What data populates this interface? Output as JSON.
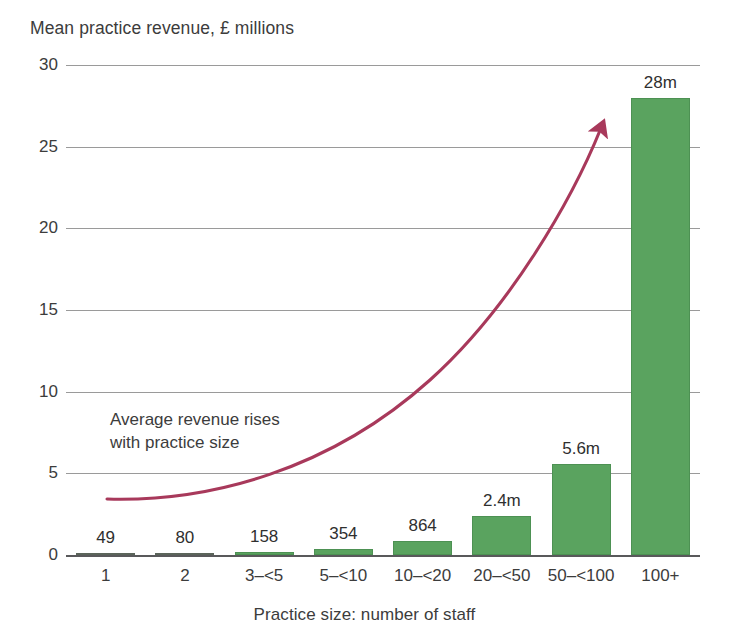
{
  "chart_data": {
    "type": "bar",
    "title": "",
    "ylabel": "Mean practice revenue, £ millions",
    "xlabel": "Practice size: number of staff",
    "ylim": [
      0,
      30
    ],
    "yticks": [
      0,
      5,
      10,
      15,
      20,
      25,
      30
    ],
    "ytick_labels": [
      "0",
      "5",
      "10",
      "15",
      "20",
      "25",
      "30"
    ],
    "grid": true,
    "legend": "none",
    "bar_color": "#5aa35f",
    "accent_color": "#a8395b",
    "categories": [
      "1",
      "2",
      "3–<5",
      "5–<10",
      "10–<20",
      "20–<50",
      "50–<100",
      "100+"
    ],
    "values": [
      0.049,
      0.08,
      0.158,
      0.354,
      0.864,
      2.4,
      5.6,
      28
    ],
    "value_labels": [
      "49",
      "80",
      "158",
      "354",
      "864",
      "2.4m",
      "5.6m",
      "28m"
    ],
    "annotations": [
      {
        "text": "Average revenue rises\nwith practice size",
        "kind": "text-note"
      },
      {
        "kind": "trend-arrow",
        "description": "rising curved arrow from left baseline to top right"
      }
    ]
  },
  "bars": [
    {
      "category": "1",
      "value": 0.049,
      "label": "49",
      "center_pct": 6.25,
      "tiny": true
    },
    {
      "category": "2",
      "value": 0.08,
      "label": "80",
      "center_pct": 18.75,
      "tiny": true
    },
    {
      "category": "3–<5",
      "value": 0.158,
      "label": "158",
      "center_pct": 31.25,
      "tiny": false
    },
    {
      "category": "5–<10",
      "value": 0.354,
      "label": "354",
      "center_pct": 43.75,
      "tiny": false
    },
    {
      "category": "10–<20",
      "value": 0.864,
      "label": "864",
      "center_pct": 56.25,
      "tiny": false
    },
    {
      "category": "20–<50",
      "value": 2.4,
      "label": "2.4m",
      "center_pct": 68.75,
      "tiny": false
    },
    {
      "category": "50–<100",
      "value": 5.6,
      "label": "5.6m",
      "center_pct": 81.25,
      "tiny": false
    },
    {
      "category": "100+",
      "value": 28,
      "label": "28m",
      "center_pct": 93.75,
      "tiny": false
    }
  ],
  "yticks": [
    {
      "value": 30,
      "label": "30"
    },
    {
      "value": 25,
      "label": "25"
    },
    {
      "value": 20,
      "label": "20"
    },
    {
      "value": 15,
      "label": "15"
    },
    {
      "value": 10,
      "label": "10"
    },
    {
      "value": 5,
      "label": "5"
    },
    {
      "value": 0,
      "label": "0"
    }
  ],
  "axis": {
    "y_title": "Mean practice revenue, £ millions",
    "x_title": "Practice size: number of staff"
  },
  "annotation": {
    "line1": "Average revenue rises",
    "line2": "with practice size"
  },
  "colors": {
    "bar_green": "#5aa35f",
    "arrow_maroon": "#a8395b",
    "gridline": "#9a9a9a",
    "text": "#3c3c3c"
  }
}
